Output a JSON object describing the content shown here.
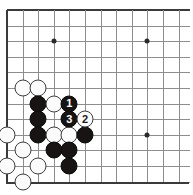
{
  "figure": {
    "kind": "go-board-diagram",
    "title": "",
    "board": {
      "columns_shown": 12,
      "rows_shown": 12,
      "origin_x": 7,
      "origin_y": 10,
      "cell": 15.6,
      "corner": "top-left",
      "line_color": "#8d8d8d",
      "edge_color": "#3a3a3a",
      "background": "#ffffff"
    },
    "star_points": [
      {
        "col": 3,
        "row": 2
      },
      {
        "col": 9,
        "row": 2
      },
      {
        "col": 9,
        "row": 8
      }
    ],
    "stones": [
      {
        "col": 1,
        "row": 5,
        "color": "white",
        "label": ""
      },
      {
        "col": 2,
        "row": 5,
        "color": "white",
        "label": ""
      },
      {
        "col": 2,
        "row": 6,
        "color": "black",
        "label": ""
      },
      {
        "col": 3,
        "row": 6,
        "color": "white",
        "label": ""
      },
      {
        "col": 4,
        "row": 6,
        "color": "black",
        "label": "1"
      },
      {
        "col": 2,
        "row": 7,
        "color": "black",
        "label": ""
      },
      {
        "col": 4,
        "row": 7,
        "color": "black",
        "label": "3"
      },
      {
        "col": 5,
        "row": 7,
        "color": "white",
        "label": "2"
      },
      {
        "col": 0,
        "row": 8,
        "color": "white",
        "label": ""
      },
      {
        "col": 2,
        "row": 8,
        "color": "black",
        "label": ""
      },
      {
        "col": 3,
        "row": 8,
        "color": "white",
        "label": ""
      },
      {
        "col": 4,
        "row": 8,
        "color": "white",
        "label": ""
      },
      {
        "col": 5,
        "row": 8,
        "color": "black",
        "label": ""
      },
      {
        "col": 1,
        "row": 9,
        "color": "white",
        "label": ""
      },
      {
        "col": 3,
        "row": 9,
        "color": "black",
        "label": ""
      },
      {
        "col": 4,
        "row": 9,
        "color": "black",
        "label": ""
      },
      {
        "col": 0,
        "row": 10,
        "color": "white",
        "label": ""
      },
      {
        "col": 2,
        "row": 10,
        "color": "white",
        "label": ""
      },
      {
        "col": 4,
        "row": 10,
        "color": "black",
        "label": ""
      },
      {
        "col": 1,
        "row": 11,
        "color": "white",
        "label": ""
      }
    ],
    "move_sequence": [
      {
        "label": "1",
        "color": "black"
      },
      {
        "label": "2",
        "color": "white"
      },
      {
        "label": "3",
        "color": "black"
      }
    ]
  }
}
